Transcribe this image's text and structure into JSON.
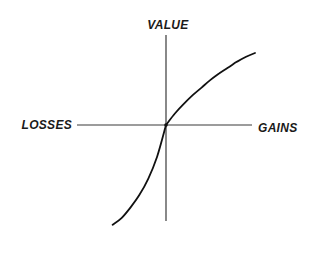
{
  "chart_data": {
    "type": "line",
    "title": "",
    "xlabel_negative": "LOSSES",
    "xlabel_positive": "GAINS",
    "ylabel": "VALUE",
    "grid": false,
    "legend": "none",
    "xlim": [
      -1,
      1
    ],
    "ylim": [
      -1.05,
      0.95
    ],
    "series": [
      {
        "name": "gains",
        "x": [
          0,
          0.1,
          0.2,
          0.3,
          0.4,
          0.5,
          0.6,
          0.7,
          0.8,
          0.9,
          1.0
        ],
        "y": [
          0,
          0.12,
          0.22,
          0.31,
          0.39,
          0.47,
          0.54,
          0.6,
          0.66,
          0.71,
          0.75
        ]
      },
      {
        "name": "losses",
        "x": [
          0,
          -0.1,
          -0.2,
          -0.3,
          -0.4,
          -0.5,
          -0.6
        ],
        "y": [
          0,
          -0.33,
          -0.56,
          -0.73,
          -0.86,
          -0.97,
          -1.04
        ]
      }
    ]
  }
}
